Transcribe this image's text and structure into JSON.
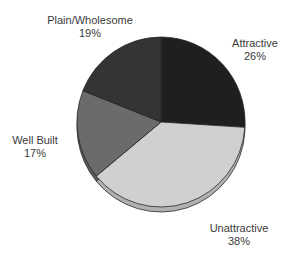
{
  "chart_data": {
    "type": "pie",
    "title": "",
    "style": "3d-pie, grayscale",
    "start_angle": "12 o'clock, clockwise",
    "categories": [
      "Attractive",
      "Unattractive",
      "Well Built",
      "Plain/Wholesome"
    ],
    "values": [
      26,
      38,
      17,
      19
    ],
    "unit": "%",
    "colors": [
      "#1f1f1f",
      "#d0d0d0",
      "#6b6b6b",
      "#343434"
    ],
    "labels": [
      {
        "name": "Attractive",
        "pct": "26%"
      },
      {
        "name": "Unattractive",
        "pct": "38%"
      },
      {
        "name": "Well Built",
        "pct": "17%"
      },
      {
        "name": "Plain/Wholesome",
        "pct": "19%"
      }
    ],
    "legend": "none (labels placed outside slices)"
  }
}
